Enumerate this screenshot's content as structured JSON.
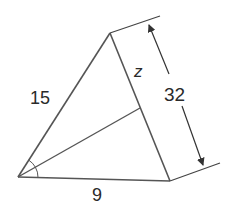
{
  "diagram": {
    "type": "triangle-angle-bisector",
    "vertices": {
      "A": {
        "x": 18,
        "y": 177
      },
      "B": {
        "x": 110,
        "y": 33
      },
      "C": {
        "x": 170,
        "y": 181
      }
    },
    "bisector_foot": {
      "x": 140,
      "y": 108
    },
    "labels": {
      "side_AB": "15",
      "side_AC": "9",
      "segment_BD": "z",
      "dimension_BC": "32"
    },
    "stroke_color": "#555555",
    "text_color": "#2a2a2a"
  }
}
